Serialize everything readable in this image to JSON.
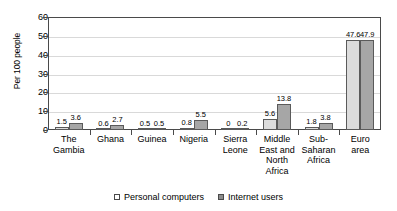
{
  "chart_data": {
    "type": "bar",
    "title": "",
    "xlabel": "",
    "ylabel": "Per 100 people",
    "ylim": [
      0,
      60
    ],
    "yticks": [
      0,
      10,
      20,
      30,
      40,
      50,
      60
    ],
    "grid": true,
    "legend_position": "bottom",
    "categories": [
      "The Gambia",
      "Ghana",
      "Guinea",
      "Nigeria",
      "Sierra Leone",
      "Middle East and North Africa",
      "Sub-Saharan Africa",
      "Euro area"
    ],
    "category_labels_multiline": [
      "The\nGambia",
      "Ghana",
      "Guinea",
      "Nigeria",
      "Sierra\nLeone",
      "Middle\nEast and\nNorth\nAfrica",
      "Sub-\nSaharan\nAfrica",
      "Euro\narea"
    ],
    "series": [
      {
        "name": "Personal computers",
        "color": "#dcdcdc",
        "values": [
          1.5,
          0.6,
          0.5,
          0.8,
          0,
          5.6,
          1.8,
          47.6
        ],
        "labels": [
          "1.5",
          "0.6",
          "0.5",
          "0.8",
          "0",
          "5.6",
          "1.8",
          "47.6"
        ]
      },
      {
        "name": "Internet users",
        "color": "#a6a6a6",
        "values": [
          3.6,
          2.7,
          0.5,
          5.5,
          0.2,
          13.8,
          3.8,
          47.9
        ],
        "labels": [
          "3.6",
          "2.7",
          "0.5",
          "5.5",
          "0.2",
          "13.8",
          "3.8",
          "47.9"
        ]
      }
    ]
  },
  "legend": {
    "items": [
      {
        "label": "Personal computers"
      },
      {
        "label": "Internet users"
      }
    ]
  }
}
